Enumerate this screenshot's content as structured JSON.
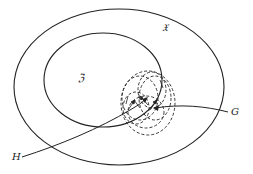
{
  "diagram": {
    "labels": {
      "outer_set": "𝔛",
      "inner_set": "ℨ",
      "arrow_g": "G",
      "arrow_h": "H"
    },
    "colors": {
      "stroke": "#222222",
      "background": "#ffffff"
    }
  }
}
